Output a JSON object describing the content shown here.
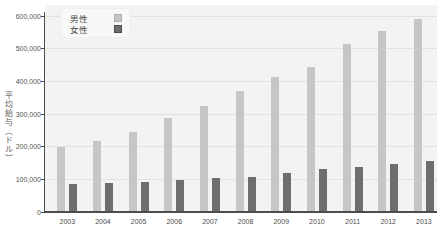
{
  "chart_data": {
    "type": "bar",
    "title": "",
    "ylabel": "平均給与（ドル）",
    "xlabel": "",
    "categories": [
      "2003",
      "2004",
      "2005",
      "2006",
      "2007",
      "2008",
      "2009",
      "2010",
      "2011",
      "2012",
      "2013"
    ],
    "series": [
      {
        "name": "男性",
        "color": "#c6c6c6",
        "values": [
          200000,
          217000,
          245000,
          287000,
          325000,
          371000,
          412000,
          445000,
          513000,
          554000,
          590000
        ]
      },
      {
        "name": "女性",
        "color": "#6e6e6e",
        "values": [
          85000,
          88000,
          92000,
          97000,
          103000,
          108000,
          118000,
          131000,
          139000,
          147000,
          157000
        ]
      }
    ],
    "ylim": [
      0,
      600000
    ],
    "yticks": [
      0,
      100000,
      200000,
      300000,
      400000,
      500000,
      600000
    ],
    "ytick_labels": [
      "0",
      "100,000",
      "200,000",
      "300,000",
      "400,000",
      "500,000",
      "600,000"
    ],
    "grid": true,
    "legend_position": "top-left-inside"
  },
  "colors": {
    "plot_background": "#f3f3f3",
    "gridline": "#e2e2e2",
    "axis": "#4d4d4d",
    "tick_text": "#555555",
    "male_bar": "#c6c6c6",
    "female_bar": "#6e6e6e"
  }
}
